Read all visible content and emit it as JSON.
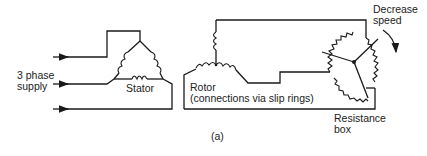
{
  "diagram": {
    "caption": "(a)",
    "labels": {
      "supply_line1": "3 phase",
      "supply_line2": "supply",
      "stator": "Stator",
      "rotor_line1": "Rotor",
      "rotor_line2": "(connections via slip rings)",
      "decrease_line1": "Decrease",
      "decrease_line2": "speed",
      "resistance_line1": "Resistance",
      "resistance_line2": "box"
    },
    "components": [
      {
        "id": "supply",
        "type": "3-phase input",
        "lines": 3
      },
      {
        "id": "stator",
        "type": "delta-connected windings",
        "coils": 3
      },
      {
        "id": "rotor",
        "type": "star-connected windings",
        "coils": 3
      },
      {
        "id": "resistance_box",
        "type": "3-arm variable rheostat with common star point"
      }
    ],
    "colors": {
      "line": "#1a1a1a",
      "background": "#ffffff"
    }
  }
}
